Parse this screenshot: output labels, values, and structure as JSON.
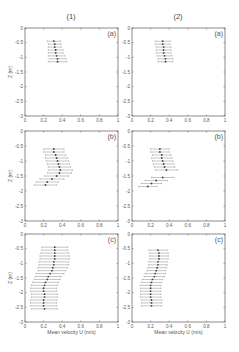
{
  "figure": {
    "column_titles": [
      "(1)",
      "(2)"
    ],
    "xlabel": "Mean velocity U (m/s)",
    "ylabel": "Z (m)",
    "x_ticks": [
      "0",
      "0.2",
      "0.4",
      "0.6",
      "0.8",
      "1"
    ],
    "y_ticks": [
      "0",
      "-0.5",
      "-1",
      "-1.5",
      "-2",
      "-2.5",
      "-3"
    ]
  },
  "chart_data": [
    {
      "type": "scatter",
      "panel": "(a)",
      "column": "(1)",
      "xlabel": "",
      "ylabel": "Z (m)",
      "xlim": [
        0,
        1
      ],
      "ylim": [
        -3,
        0
      ],
      "points": [
        {
          "z": -0.45,
          "u": 0.31,
          "err": 0.07
        },
        {
          "z": -0.55,
          "u": 0.32,
          "err": 0.07
        },
        {
          "z": -0.65,
          "u": 0.32,
          "err": 0.07
        },
        {
          "z": -0.75,
          "u": 0.33,
          "err": 0.08
        },
        {
          "z": -0.85,
          "u": 0.33,
          "err": 0.08
        },
        {
          "z": -0.95,
          "u": 0.34,
          "err": 0.09
        },
        {
          "z": -1.05,
          "u": 0.35,
          "err": 0.09
        },
        {
          "z": -1.15,
          "u": 0.35,
          "err": 0.1
        }
      ]
    },
    {
      "type": "scatter",
      "panel": "(a)",
      "column": "(2)",
      "xlabel": "",
      "ylabel": "",
      "xlim": [
        0,
        1
      ],
      "ylim": [
        -3,
        0
      ],
      "points": [
        {
          "z": -0.45,
          "u": 0.33,
          "err": 0.08
        },
        {
          "z": -0.55,
          "u": 0.33,
          "err": 0.08
        },
        {
          "z": -0.65,
          "u": 0.34,
          "err": 0.08
        },
        {
          "z": -0.75,
          "u": 0.34,
          "err": 0.08
        },
        {
          "z": -0.85,
          "u": 0.34,
          "err": 0.08
        },
        {
          "z": -0.95,
          "u": 0.35,
          "err": 0.08
        },
        {
          "z": -1.05,
          "u": 0.36,
          "err": 0.08
        },
        {
          "z": -1.15,
          "u": 0.36,
          "err": 0.08
        }
      ]
    },
    {
      "type": "scatter",
      "panel": "(b)",
      "column": "(1)",
      "xlabel": "",
      "ylabel": "Z (m)",
      "xlim": [
        0,
        1
      ],
      "ylim": [
        -3,
        0
      ],
      "points": [
        {
          "z": -0.6,
          "u": 0.31,
          "err": 0.11
        },
        {
          "z": -0.7,
          "u": 0.31,
          "err": 0.11
        },
        {
          "z": -0.8,
          "u": 0.33,
          "err": 0.11
        },
        {
          "z": -0.9,
          "u": 0.34,
          "err": 0.12
        },
        {
          "z": -1.0,
          "u": 0.35,
          "err": 0.12
        },
        {
          "z": -1.1,
          "u": 0.36,
          "err": 0.12
        },
        {
          "z": -1.2,
          "u": 0.37,
          "err": 0.12
        },
        {
          "z": -1.3,
          "u": 0.38,
          "err": 0.13
        },
        {
          "z": -1.4,
          "u": 0.37,
          "err": 0.13
        },
        {
          "z": -1.5,
          "u": 0.34,
          "err": 0.13
        },
        {
          "z": -1.6,
          "u": 0.29,
          "err": 0.13
        },
        {
          "z": -1.7,
          "u": 0.24,
          "err": 0.12
        },
        {
          "z": -1.8,
          "u": 0.22,
          "err": 0.12
        }
      ]
    },
    {
      "type": "scatter",
      "panel": "(b)",
      "column": "(2)",
      "xlabel": "",
      "ylabel": "",
      "xlim": [
        0,
        1
      ],
      "ylim": [
        -3,
        0
      ],
      "points": [
        {
          "z": -0.6,
          "u": 0.3,
          "err": 0.1
        },
        {
          "z": -0.7,
          "u": 0.3,
          "err": 0.1
        },
        {
          "z": -0.8,
          "u": 0.32,
          "err": 0.1
        },
        {
          "z": -0.9,
          "u": 0.32,
          "err": 0.11
        },
        {
          "z": -1.0,
          "u": 0.33,
          "err": 0.11
        },
        {
          "z": -1.1,
          "u": 0.34,
          "err": 0.11
        },
        {
          "z": -1.2,
          "u": 0.35,
          "err": 0.11
        },
        {
          "z": -1.3,
          "u": 0.37,
          "err": 0.12
        },
        {
          "z": -1.55,
          "u": 0.33,
          "err": 0.12
        },
        {
          "z": -1.65,
          "u": 0.26,
          "err": 0.12
        },
        {
          "z": -1.75,
          "u": 0.21,
          "err": 0.11
        },
        {
          "z": -1.85,
          "u": 0.17,
          "err": 0.1
        }
      ]
    },
    {
      "type": "scatter",
      "panel": "(c)",
      "column": "(1)",
      "xlabel": "Mean velocity U (m/s)",
      "ylabel": "Z (m)",
      "xlim": [
        0,
        1
      ],
      "ylim": [
        -3,
        0
      ],
      "points": [
        {
          "z": -0.45,
          "u": 0.32,
          "err": 0.14
        },
        {
          "z": -0.55,
          "u": 0.32,
          "err": 0.14
        },
        {
          "z": -0.65,
          "u": 0.32,
          "err": 0.15
        },
        {
          "z": -0.75,
          "u": 0.32,
          "err": 0.16
        },
        {
          "z": -0.85,
          "u": 0.32,
          "err": 0.16
        },
        {
          "z": -0.95,
          "u": 0.31,
          "err": 0.16
        },
        {
          "z": -1.05,
          "u": 0.31,
          "err": 0.16
        },
        {
          "z": -1.15,
          "u": 0.3,
          "err": 0.16
        },
        {
          "z": -1.25,
          "u": 0.29,
          "err": 0.15
        },
        {
          "z": -1.35,
          "u": 0.27,
          "err": 0.15
        },
        {
          "z": -1.45,
          "u": 0.25,
          "err": 0.14
        },
        {
          "z": -1.55,
          "u": 0.24,
          "err": 0.14
        },
        {
          "z": -1.65,
          "u": 0.22,
          "err": 0.14
        },
        {
          "z": -1.75,
          "u": 0.21,
          "err": 0.14
        },
        {
          "z": -1.85,
          "u": 0.2,
          "err": 0.14
        },
        {
          "z": -1.95,
          "u": 0.2,
          "err": 0.14
        },
        {
          "z": -2.05,
          "u": 0.21,
          "err": 0.14
        },
        {
          "z": -2.15,
          "u": 0.21,
          "err": 0.14
        },
        {
          "z": -2.25,
          "u": 0.2,
          "err": 0.14
        },
        {
          "z": -2.35,
          "u": 0.2,
          "err": 0.14
        },
        {
          "z": -2.45,
          "u": 0.2,
          "err": 0.14
        },
        {
          "z": -2.55,
          "u": 0.21,
          "err": 0.14
        }
      ]
    },
    {
      "type": "scatter",
      "panel": "(c)",
      "column": "(2)",
      "xlabel": "Mean velocity U (m/s)",
      "ylabel": "",
      "xlim": [
        0,
        1
      ],
      "ylim": [
        -3,
        0
      ],
      "points": [
        {
          "z": -0.55,
          "u": 0.28,
          "err": 0.1
        },
        {
          "z": -0.65,
          "u": 0.29,
          "err": 0.1
        },
        {
          "z": -0.75,
          "u": 0.29,
          "err": 0.1
        },
        {
          "z": -0.85,
          "u": 0.29,
          "err": 0.1
        },
        {
          "z": -0.95,
          "u": 0.28,
          "err": 0.1
        },
        {
          "z": -1.05,
          "u": 0.28,
          "err": 0.1
        },
        {
          "z": -1.15,
          "u": 0.27,
          "err": 0.1
        },
        {
          "z": -1.25,
          "u": 0.26,
          "err": 0.1
        },
        {
          "z": -1.35,
          "u": 0.25,
          "err": 0.11
        },
        {
          "z": -1.45,
          "u": 0.24,
          "err": 0.11
        },
        {
          "z": -1.55,
          "u": 0.22,
          "err": 0.11
        },
        {
          "z": -1.65,
          "u": 0.21,
          "err": 0.11
        },
        {
          "z": -1.75,
          "u": 0.2,
          "err": 0.11
        },
        {
          "z": -1.85,
          "u": 0.2,
          "err": 0.11
        },
        {
          "z": -1.95,
          "u": 0.2,
          "err": 0.11
        },
        {
          "z": -2.05,
          "u": 0.2,
          "err": 0.11
        },
        {
          "z": -2.15,
          "u": 0.2,
          "err": 0.11
        },
        {
          "z": -2.25,
          "u": 0.21,
          "err": 0.11
        },
        {
          "z": -2.35,
          "u": 0.21,
          "err": 0.11
        },
        {
          "z": -2.45,
          "u": 0.21,
          "err": 0.11
        }
      ]
    }
  ]
}
